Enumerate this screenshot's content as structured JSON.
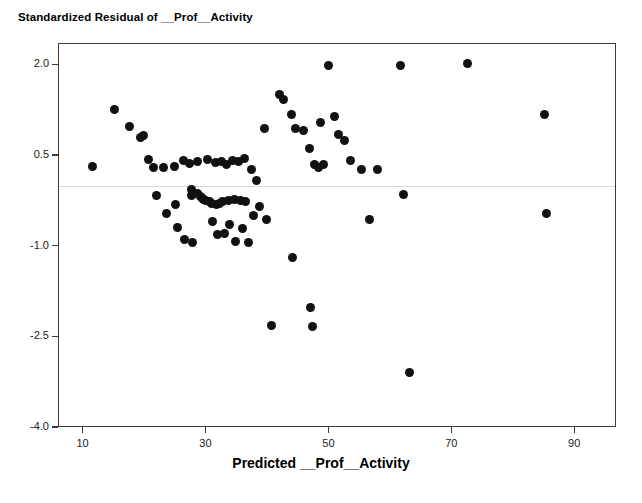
{
  "chart_data": {
    "type": "scatter",
    "title": "Standardized Residual of __Prof__Activity",
    "xlabel": "Predicted __Prof__Activity",
    "ylabel": "",
    "xlim": [
      6.0,
      96.8
    ],
    "ylim": [
      -4.0,
      2.35
    ],
    "xticks": [
      10,
      30,
      50,
      70,
      90
    ],
    "xtick_labels": [
      "10",
      "30",
      "50",
      "70",
      "90"
    ],
    "yticks": [
      2.0,
      0.5,
      -1.0,
      -2.5,
      -4.0
    ],
    "ytick_labels": [
      "2.0",
      "0.5",
      "-1.0",
      "-2.5",
      "-4.0"
    ],
    "grid": false,
    "legend": null,
    "reference_line": {
      "orientation": "horizontal",
      "y": 0.0,
      "color": "#d8d8d8"
    },
    "marker": {
      "shape": "circle",
      "color": "#111111",
      "size": 9
    },
    "points": [
      {
        "x": 11.5,
        "y": 0.33
      },
      {
        "x": 15.0,
        "y": 1.26
      },
      {
        "x": 17.5,
        "y": 0.98
      },
      {
        "x": 19.3,
        "y": 0.8
      },
      {
        "x": 19.8,
        "y": 0.84
      },
      {
        "x": 20.5,
        "y": 0.44
      },
      {
        "x": 21.3,
        "y": 0.3
      },
      {
        "x": 21.8,
        "y": -0.16
      },
      {
        "x": 23.0,
        "y": 0.3
      },
      {
        "x": 23.5,
        "y": -0.45
      },
      {
        "x": 24.8,
        "y": 0.33
      },
      {
        "x": 25.0,
        "y": -0.31
      },
      {
        "x": 25.3,
        "y": -0.68
      },
      {
        "x": 26.2,
        "y": 0.42
      },
      {
        "x": 26.5,
        "y": -0.88
      },
      {
        "x": 27.3,
        "y": 0.38
      },
      {
        "x": 27.5,
        "y": -0.05
      },
      {
        "x": 27.6,
        "y": -0.15
      },
      {
        "x": 27.8,
        "y": -0.94
      },
      {
        "x": 28.5,
        "y": 0.4
      },
      {
        "x": 28.6,
        "y": -0.12
      },
      {
        "x": 29.0,
        "y": -0.18
      },
      {
        "x": 29.3,
        "y": -0.2
      },
      {
        "x": 29.5,
        "y": -0.22
      },
      {
        "x": 29.8,
        "y": -0.24
      },
      {
        "x": 30.2,
        "y": 0.44
      },
      {
        "x": 30.5,
        "y": -0.26
      },
      {
        "x": 30.8,
        "y": -0.28
      },
      {
        "x": 31.0,
        "y": -0.58
      },
      {
        "x": 31.4,
        "y": 0.39
      },
      {
        "x": 31.6,
        "y": -0.3
      },
      {
        "x": 31.8,
        "y": -0.8
      },
      {
        "x": 32.1,
        "y": -0.28
      },
      {
        "x": 32.4,
        "y": 0.41
      },
      {
        "x": 32.6,
        "y": -0.26
      },
      {
        "x": 32.9,
        "y": -0.78
      },
      {
        "x": 33.3,
        "y": 0.36
      },
      {
        "x": 33.6,
        "y": -0.24
      },
      {
        "x": 33.8,
        "y": -0.64
      },
      {
        "x": 34.2,
        "y": 0.42
      },
      {
        "x": 34.5,
        "y": -0.22
      },
      {
        "x": 34.8,
        "y": -0.92
      },
      {
        "x": 35.2,
        "y": 0.4
      },
      {
        "x": 35.5,
        "y": -0.24
      },
      {
        "x": 35.8,
        "y": -0.7
      },
      {
        "x": 36.2,
        "y": 0.45
      },
      {
        "x": 36.4,
        "y": -0.26
      },
      {
        "x": 36.8,
        "y": -0.94
      },
      {
        "x": 37.3,
        "y": 0.28
      },
      {
        "x": 37.6,
        "y": -0.48
      },
      {
        "x": 38.2,
        "y": 0.1
      },
      {
        "x": 38.6,
        "y": -0.34
      },
      {
        "x": 39.5,
        "y": 0.95
      },
      {
        "x": 39.8,
        "y": -0.56
      },
      {
        "x": 40.5,
        "y": -2.3
      },
      {
        "x": 41.8,
        "y": 1.52
      },
      {
        "x": 42.6,
        "y": 1.44
      },
      {
        "x": 43.8,
        "y": 1.18
      },
      {
        "x": 44.0,
        "y": -1.18
      },
      {
        "x": 44.5,
        "y": 0.95
      },
      {
        "x": 45.8,
        "y": 0.92
      },
      {
        "x": 46.8,
        "y": 0.63
      },
      {
        "x": 47.0,
        "y": -2.0
      },
      {
        "x": 47.2,
        "y": -2.32
      },
      {
        "x": 47.5,
        "y": 0.35
      },
      {
        "x": 48.2,
        "y": 0.3
      },
      {
        "x": 48.5,
        "y": 1.06
      },
      {
        "x": 49.0,
        "y": 0.36
      },
      {
        "x": 49.8,
        "y": 1.99
      },
      {
        "x": 50.8,
        "y": 1.15
      },
      {
        "x": 51.5,
        "y": 0.86
      },
      {
        "x": 52.5,
        "y": 0.75
      },
      {
        "x": 53.5,
        "y": 0.42
      },
      {
        "x": 55.2,
        "y": 0.28
      },
      {
        "x": 56.5,
        "y": -0.55
      },
      {
        "x": 57.8,
        "y": 0.28
      },
      {
        "x": 61.5,
        "y": 1.99
      },
      {
        "x": 62.0,
        "y": -0.14
      },
      {
        "x": 63.0,
        "y": -3.08
      },
      {
        "x": 72.5,
        "y": 2.03
      },
      {
        "x": 85.0,
        "y": 1.18
      },
      {
        "x": 85.3,
        "y": -0.45
      }
    ]
  },
  "axes": {
    "x_tick_labels": [
      "10",
      "30",
      "50",
      "70",
      "90"
    ],
    "y_tick_labels": [
      "2.0",
      "0.5",
      "-1.0",
      "-2.5",
      "-4.0"
    ],
    "x_axis_title": "Predicted __Prof__Activity",
    "plot_title": "Standardized Residual of __Prof__Activity"
  }
}
